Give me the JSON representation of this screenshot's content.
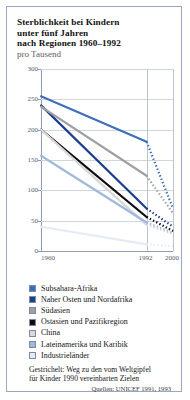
{
  "card": {
    "border_color": "#9aa8bf"
  },
  "title": {
    "line1": "Sterblichkeit bei Kindern",
    "line2": "unter fünf Jahren",
    "line3": "nach Regionen 1960–1992",
    "subtitle": "pro Tausend"
  },
  "axes": {
    "y_ticks": [
      "300",
      "250",
      "200",
      "150",
      "100",
      "50",
      "0"
    ],
    "y_values": [
      300,
      250,
      200,
      150,
      100,
      50,
      0
    ],
    "x_ticks": [
      "1960",
      "1992",
      "2000"
    ],
    "x_values": [
      1960,
      1992,
      2000
    ]
  },
  "legend": {
    "items": [
      {
        "label": "Subsahara-Afrika",
        "color": "#3d6fbd"
      },
      {
        "label": "Naher Osten und Nordafrika",
        "color": "#1b3f8f"
      },
      {
        "label": "Südasien",
        "color": "#a0a0a0"
      },
      {
        "label": "Ostasien und Pazifikregion",
        "color": "#0d0d0d"
      },
      {
        "label": "China",
        "color": "#d8d8d8"
      },
      {
        "label": "Lateinamerika und Karibik",
        "color": "#9fb9dd"
      },
      {
        "label": "Industrieländer",
        "color": "#e3ebf5"
      }
    ]
  },
  "note": {
    "line1": "Gestrichelt: Weg zu den vom Weltgipfel",
    "line2": "für Kinder 1990 vereinbarten Zielen"
  },
  "source": "Quellen: UNICEF 1991, 1993",
  "chart_data": {
    "type": "line",
    "title": "Sterblichkeit bei Kindern unter fünf Jahren nach Regionen 1960–1992",
    "subtitle": "pro Tausend",
    "xlabel": "",
    "ylabel": "pro Tausend",
    "xlim": [
      1960,
      2000
    ],
    "ylim": [
      0,
      300
    ],
    "grid": true,
    "legend_position": "below",
    "x": [
      1960,
      1992,
      2000
    ],
    "series": [
      {
        "name": "Subsahara-Afrika",
        "color": "#3d6fbd",
        "values": [
          255,
          180,
          70
        ],
        "dashed_from": 1992
      },
      {
        "name": "Naher Osten und Nordafrika",
        "color": "#1b3f8f",
        "values": [
          240,
          70,
          40
        ],
        "dashed_from": 1992
      },
      {
        "name": "Südasien",
        "color": "#a0a0a0",
        "values": [
          238,
          124,
          62
        ],
        "dashed_from": 1992
      },
      {
        "name": "Ostasien und Pazifikregion",
        "color": "#0d0d0d",
        "values": [
          200,
          56,
          33
        ],
        "dashed_from": 1992
      },
      {
        "name": "China",
        "color": "#d8d8d8",
        "values": [
          200,
          43,
          28
        ],
        "dashed_from": 1992
      },
      {
        "name": "Lateinamerika und Karibik",
        "color": "#9fb9dd",
        "values": [
          157,
          47,
          30
        ],
        "dashed_from": 1992
      },
      {
        "name": "Industrieländer",
        "color": "#e3ebf5",
        "values": [
          40,
          11,
          8
        ],
        "dashed_from": 1992
      }
    ],
    "annotation": "Gestrichelt: Weg zu den vom Weltgipfel für Kinder 1990 vereinbarten Zielen",
    "source": "Quellen: UNICEF 1991, 1993"
  }
}
